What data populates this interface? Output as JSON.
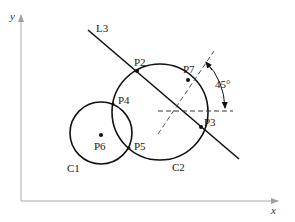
{
  "diagram": {
    "axes": {
      "x_label": "x",
      "y_label": "y",
      "color": "#a0a0a0"
    },
    "circles": [
      {
        "id": "C1",
        "label": "C1"
      },
      {
        "id": "C2",
        "label": "C2"
      }
    ],
    "line": {
      "id": "L3",
      "label": "L3"
    },
    "points": [
      {
        "id": "P2",
        "label": "P2"
      },
      {
        "id": "P3",
        "label": "P3"
      },
      {
        "id": "P4",
        "label": "P4"
      },
      {
        "id": "P5",
        "label": "P5"
      },
      {
        "id": "P6",
        "label": "P6"
      },
      {
        "id": "P7",
        "label": "P7"
      }
    ],
    "angle": {
      "label": "45°"
    },
    "colors": {
      "stroke": "#111111",
      "dashed": "#333333"
    }
  }
}
